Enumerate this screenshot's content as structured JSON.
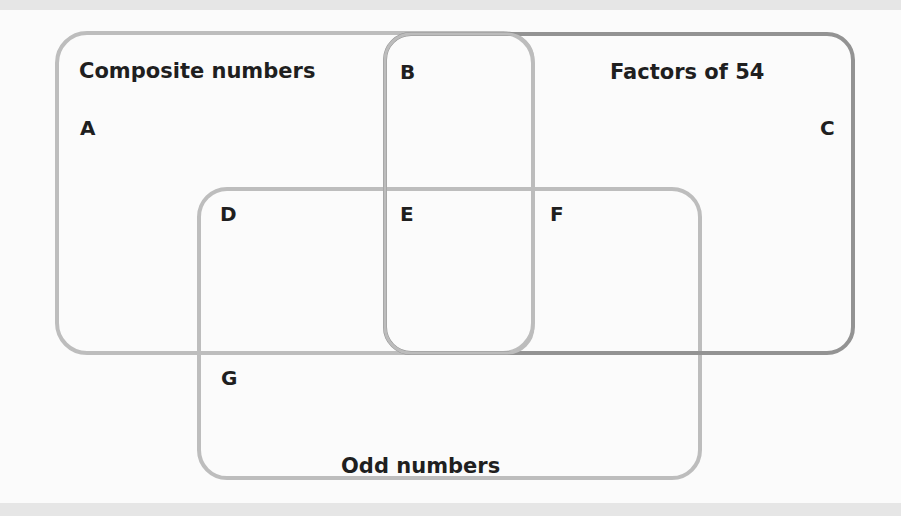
{
  "diagram": {
    "type": "venn",
    "sets": [
      {
        "id": "composite",
        "label": "Composite numbers"
      },
      {
        "id": "factors54",
        "label": "Factors of 54"
      },
      {
        "id": "odd",
        "label": "Odd numbers"
      }
    ],
    "regions": [
      {
        "id": "A",
        "label": "A"
      },
      {
        "id": "B",
        "label": "B"
      },
      {
        "id": "C",
        "label": "C"
      },
      {
        "id": "D",
        "label": "D"
      },
      {
        "id": "E",
        "label": "E"
      },
      {
        "id": "F",
        "label": "F"
      },
      {
        "id": "G",
        "label": "G"
      }
    ],
    "colors": {
      "light_stroke": "#b9b9b9",
      "dark_stroke": "#8f8f8f",
      "text": "#1f1f1f",
      "background": "#fbfbfb",
      "band": "#e6e6e6"
    }
  }
}
